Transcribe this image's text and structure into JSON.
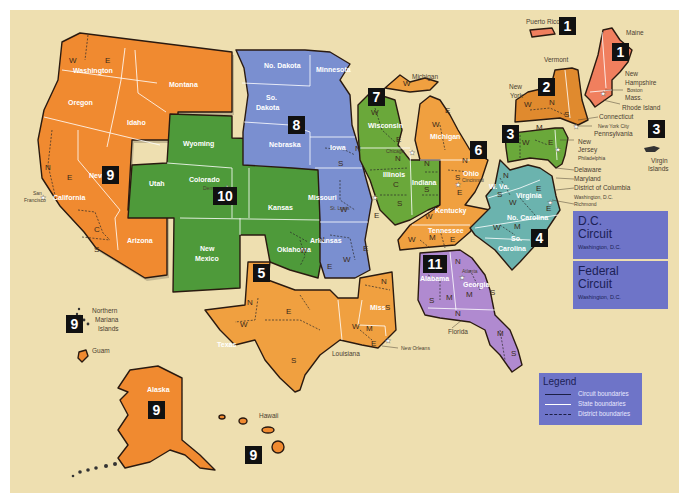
{
  "map": {
    "title": "Geographic Boundaries of United States Courts of Appeals and United States District Courts",
    "background_color": "#eedfb0",
    "circuit_colors": {
      "1": "#f07f5e",
      "2": "#e08a2e",
      "3": "#6aa83a",
      "4": "#6bb3ae",
      "5": "#f0a040",
      "6": "#f0a040",
      "7": "#6aa83a",
      "8": "#7a8fd0",
      "9": "#f08a30",
      "10": "#4e9a3a",
      "11": "#b08ad0"
    }
  },
  "circuits": [
    {
      "number": "1",
      "states": [
        "Maine",
        "New Hampshire",
        "Mass.",
        "Rhode Island",
        "Puerto Rico"
      ],
      "cities": [
        "Boston"
      ]
    },
    {
      "number": "2",
      "states": [
        "New York",
        "Vermont",
        "Connecticut"
      ],
      "cities": [
        "New York City"
      ]
    },
    {
      "number": "3",
      "states": [
        "Pennsylvania",
        "New Jersey",
        "Delaware",
        "Virgin Islands"
      ],
      "cities": [
        "Philadelphia"
      ]
    },
    {
      "number": "4",
      "states": [
        "W. Va.",
        "Virginia",
        "Maryland",
        "No. Carolina",
        "So. Carolina"
      ],
      "cities": [
        "Richmond"
      ]
    },
    {
      "number": "5",
      "states": [
        "Texas",
        "Louisiana",
        "Miss."
      ],
      "cities": [
        "New Orleans"
      ]
    },
    {
      "number": "6",
      "states": [
        "Michigan",
        "Ohio",
        "Kentucky",
        "Tennessee"
      ],
      "cities": [
        "Cincinnati"
      ]
    },
    {
      "number": "7",
      "states": [
        "Wisconsin",
        "Illinois",
        "Indiana"
      ],
      "cities": [
        "Chicago"
      ]
    },
    {
      "number": "8",
      "states": [
        "No. Dakota",
        "So. Dakota",
        "Minnesota",
        "Nebraska",
        "Iowa",
        "Missouri",
        "Arkansas"
      ],
      "cities": [
        "St. Louis"
      ]
    },
    {
      "number": "9",
      "states": [
        "Washington",
        "Oregon",
        "California",
        "Nevada",
        "Idaho",
        "Montana",
        "Arizona",
        "Alaska",
        "Hawaii",
        "Guam",
        "Northern Mariana Islands"
      ],
      "cities": [
        "San Francisco"
      ]
    },
    {
      "number": "10",
      "states": [
        "Wyoming",
        "Utah",
        "Colorado",
        "Kansas",
        "New Mexico",
        "Oklahoma"
      ],
      "cities": [
        "Denver"
      ]
    },
    {
      "number": "11",
      "states": [
        "Alabama",
        "Georgia",
        "Florida"
      ],
      "cities": [
        "Atlanta"
      ]
    }
  ],
  "badges": [
    {
      "id": "b1-pr",
      "label": "1",
      "x": 559,
      "y": 17
    },
    {
      "id": "b1-ne",
      "label": "1",
      "x": 612,
      "y": 43
    },
    {
      "id": "b2",
      "label": "2",
      "x": 538,
      "y": 78
    },
    {
      "id": "b3",
      "label": "3",
      "x": 502,
      "y": 125
    },
    {
      "id": "b3-vi",
      "label": "3",
      "x": 648,
      "y": 120
    },
    {
      "id": "b4",
      "label": "4",
      "x": 531,
      "y": 229
    },
    {
      "id": "b5",
      "label": "5",
      "x": 253,
      "y": 264
    },
    {
      "id": "b6",
      "label": "6",
      "x": 470,
      "y": 141
    },
    {
      "id": "b7",
      "label": "7",
      "x": 368,
      "y": 88
    },
    {
      "id": "b8",
      "label": "8",
      "x": 288,
      "y": 116
    },
    {
      "id": "b9-w",
      "label": "9",
      "x": 102,
      "y": 166
    },
    {
      "id": "b9-ak",
      "label": "9",
      "x": 148,
      "y": 401
    },
    {
      "id": "b9-hi",
      "label": "9",
      "x": 245,
      "y": 446
    },
    {
      "id": "b9-gu",
      "label": "9",
      "x": 66,
      "y": 315
    },
    {
      "id": "b10",
      "label": "10",
      "x": 213,
      "y": 187
    },
    {
      "id": "b11",
      "label": "11",
      "x": 423,
      "y": 255
    }
  ],
  "state_labels": [
    {
      "text": "Washington",
      "x": 73,
      "y": 73
    },
    {
      "text": "Oregon",
      "x": 68,
      "y": 105
    },
    {
      "text": "Montana",
      "x": 169,
      "y": 87
    },
    {
      "text": "Idaho",
      "x": 127,
      "y": 125
    },
    {
      "text": "Nevada",
      "x": 89,
      "y": 178
    },
    {
      "text": "California",
      "x": 53,
      "y": 200
    },
    {
      "text": "Arizona",
      "x": 127,
      "y": 243
    },
    {
      "text": "Wyoming",
      "x": 183,
      "y": 146
    },
    {
      "text": "Utah",
      "x": 149,
      "y": 186
    },
    {
      "text": "Colorado",
      "x": 189,
      "y": 182
    },
    {
      "text": "Kansas",
      "x": 268,
      "y": 210
    },
    {
      "text": "New",
      "x": 200,
      "y": 251
    },
    {
      "text": "Mexico",
      "x": 195,
      "y": 261
    },
    {
      "text": "Oklahoma",
      "x": 277,
      "y": 252
    },
    {
      "text": "No. Dakota",
      "x": 264,
      "y": 68
    },
    {
      "text": "Minnesota",
      "x": 316,
      "y": 72
    },
    {
      "text": "So.",
      "x": 266,
      "y": 100
    },
    {
      "text": "Dakota",
      "x": 256,
      "y": 110
    },
    {
      "text": "Nebraska",
      "x": 269,
      "y": 147
    },
    {
      "text": "Iowa",
      "x": 330,
      "y": 150
    },
    {
      "text": "Missouri",
      "x": 308,
      "y": 200
    },
    {
      "text": "Arkansas",
      "x": 310,
      "y": 243
    },
    {
      "text": "Wisconsin",
      "x": 368,
      "y": 128
    },
    {
      "text": "Illinois",
      "x": 383,
      "y": 177
    },
    {
      "text": "Indiana",
      "x": 412,
      "y": 185
    },
    {
      "text": "Michigan",
      "x": 430,
      "y": 139
    },
    {
      "text": "Ohio",
      "x": 463,
      "y": 176
    },
    {
      "text": "Kentucky",
      "x": 435,
      "y": 213
    },
    {
      "text": "Tennessee",
      "x": 428,
      "y": 233
    },
    {
      "text": "W. Va.",
      "x": 489,
      "y": 189
    },
    {
      "text": "Virginia",
      "x": 516,
      "y": 198
    },
    {
      "text": "No. Carolina",
      "x": 507,
      "y": 220
    },
    {
      "text": "So.",
      "x": 511,
      "y": 241
    },
    {
      "text": "Carolina",
      "x": 498,
      "y": 251
    },
    {
      "text": "Texas",
      "x": 217,
      "y": 347
    },
    {
      "text": "Miss.",
      "x": 370,
      "y": 310
    },
    {
      "text": "Alabama",
      "x": 420,
      "y": 281
    },
    {
      "text": "Georgia",
      "x": 463,
      "y": 287
    },
    {
      "text": "Alaska",
      "x": 147,
      "y": 392
    }
  ],
  "district_labels": [
    {
      "text": "W",
      "x": 69,
      "y": 63
    },
    {
      "text": "E",
      "x": 105,
      "y": 63
    },
    {
      "text": "N",
      "x": 45,
      "y": 170
    },
    {
      "text": "E",
      "x": 67,
      "y": 180
    },
    {
      "text": "C",
      "x": 94,
      "y": 232
    },
    {
      "text": "S",
      "x": 94,
      "y": 252
    },
    {
      "text": "W",
      "x": 300,
      "y": 253
    },
    {
      "text": "N",
      "x": 319,
      "y": 242
    },
    {
      "text": "E",
      "x": 327,
      "y": 269
    },
    {
      "text": "N",
      "x": 355,
      "y": 151
    },
    {
      "text": "S",
      "x": 338,
      "y": 166
    },
    {
      "text": "W",
      "x": 340,
      "y": 212
    },
    {
      "text": "E",
      "x": 374,
      "y": 218
    },
    {
      "text": "E",
      "x": 363,
      "y": 251
    },
    {
      "text": "W",
      "x": 343,
      "y": 262
    },
    {
      "text": "W",
      "x": 371,
      "y": 115
    },
    {
      "text": "E",
      "x": 396,
      "y": 142
    },
    {
      "text": "N",
      "x": 395,
      "y": 161
    },
    {
      "text": "C",
      "x": 393,
      "y": 187
    },
    {
      "text": "S",
      "x": 397,
      "y": 206
    },
    {
      "text": "N",
      "x": 424,
      "y": 166
    },
    {
      "text": "S",
      "x": 424,
      "y": 192
    },
    {
      "text": "W",
      "x": 403,
      "y": 86
    },
    {
      "text": "E",
      "x": 445,
      "y": 113
    },
    {
      "text": "W",
      "x": 432,
      "y": 127
    },
    {
      "text": "N",
      "x": 462,
      "y": 163
    },
    {
      "text": "S",
      "x": 455,
      "y": 180
    },
    {
      "text": "E",
      "x": 457,
      "y": 195
    },
    {
      "text": "W",
      "x": 425,
      "y": 219
    },
    {
      "text": "W",
      "x": 408,
      "y": 242
    },
    {
      "text": "M",
      "x": 429,
      "y": 240
    },
    {
      "text": "E",
      "x": 450,
      "y": 242
    },
    {
      "text": "W",
      "x": 522,
      "y": 145
    },
    {
      "text": "M",
      "x": 536,
      "y": 130
    },
    {
      "text": "E",
      "x": 548,
      "y": 145
    },
    {
      "text": "W",
      "x": 524,
      "y": 107
    },
    {
      "text": "N",
      "x": 549,
      "y": 105
    },
    {
      "text": "S",
      "x": 564,
      "y": 117
    },
    {
      "text": "N",
      "x": 503,
      "y": 178
    },
    {
      "text": "S",
      "x": 497,
      "y": 197
    },
    {
      "text": "W",
      "x": 509,
      "y": 205
    },
    {
      "text": "E",
      "x": 536,
      "y": 191
    },
    {
      "text": "E",
      "x": 546,
      "y": 211
    },
    {
      "text": "W",
      "x": 493,
      "y": 230
    },
    {
      "text": "M",
      "x": 514,
      "y": 229
    },
    {
      "text": "N",
      "x": 247,
      "y": 305
    },
    {
      "text": "W",
      "x": 240,
      "y": 327
    },
    {
      "text": "E",
      "x": 286,
      "y": 314
    },
    {
      "text": "S",
      "x": 291,
      "y": 363
    },
    {
      "text": "W",
      "x": 352,
      "y": 329
    },
    {
      "text": "M",
      "x": 366,
      "y": 331
    },
    {
      "text": "E",
      "x": 371,
      "y": 346
    },
    {
      "text": "N",
      "x": 381,
      "y": 284
    },
    {
      "text": "S",
      "x": 385,
      "y": 310
    },
    {
      "text": "N",
      "x": 437,
      "y": 265
    },
    {
      "text": "N",
      "x": 455,
      "y": 264
    },
    {
      "text": "S",
      "x": 429,
      "y": 303
    },
    {
      "text": "M",
      "x": 446,
      "y": 300
    },
    {
      "text": "M",
      "x": 466,
      "y": 297
    },
    {
      "text": "S",
      "x": 490,
      "y": 295
    },
    {
      "text": "N",
      "x": 455,
      "y": 316
    },
    {
      "text": "M",
      "x": 497,
      "y": 336
    },
    {
      "text": "S",
      "x": 511,
      "y": 356
    }
  ],
  "external_labels": [
    {
      "text": "Puerto Rico",
      "x": 526,
      "y": 24
    },
    {
      "text": "Maine",
      "x": 626,
      "y": 35
    },
    {
      "text": "Vermont",
      "x": 544,
      "y": 62
    },
    {
      "text": "New",
      "x": 509,
      "y": 89
    },
    {
      "text": "York",
      "x": 510,
      "y": 98
    },
    {
      "text": "New",
      "x": 625,
      "y": 76
    },
    {
      "text": "Hampshire",
      "x": 625,
      "y": 85
    },
    {
      "text": "Mass.",
      "x": 625,
      "y": 100
    },
    {
      "text": "Rhode Island",
      "x": 622,
      "y": 110
    },
    {
      "text": "Connecticut",
      "x": 599,
      "y": 119
    },
    {
      "text": "Pennsylvania",
      "x": 594,
      "y": 136
    },
    {
      "text": "New",
      "x": 578,
      "y": 144
    },
    {
      "text": "Jersey",
      "x": 578,
      "y": 152
    },
    {
      "text": "Delaware",
      "x": 574,
      "y": 172
    },
    {
      "text": "Maryland",
      "x": 574,
      "y": 181
    },
    {
      "text": "District of Columbia",
      "x": 574,
      "y": 190
    },
    {
      "text": "Virgin",
      "x": 651,
      "y": 163
    },
    {
      "text": "Islands",
      "x": 648,
      "y": 171
    },
    {
      "text": "Michigan",
      "x": 412,
      "y": 79
    },
    {
      "text": "Florida",
      "x": 448,
      "y": 334
    },
    {
      "text": "Louisiana",
      "x": 332,
      "y": 356
    },
    {
      "text": "Northern",
      "x": 92,
      "y": 313
    },
    {
      "text": "Mariana",
      "x": 95,
      "y": 322
    },
    {
      "text": "Islands",
      "x": 98,
      "y": 331
    },
    {
      "text": "Guam",
      "x": 92,
      "y": 353
    },
    {
      "text": "Hawaii",
      "x": 259,
      "y": 418
    }
  ],
  "city_labels": [
    {
      "text": "Boston",
      "x": 627,
      "y": 92
    },
    {
      "text": "New York City",
      "x": 598,
      "y": 128
    },
    {
      "text": "Philadelphia",
      "x": 578,
      "y": 160
    },
    {
      "text": "Washington, D.C.",
      "x": 574,
      "y": 199
    },
    {
      "text": "Richmond",
      "x": 574,
      "y": 206
    },
    {
      "text": "San",
      "x": 33,
      "y": 195
    },
    {
      "text": "Francisco",
      "x": 24,
      "y": 202
    },
    {
      "text": "Denver",
      "x": 203,
      "y": 190
    },
    {
      "text": "Chicago",
      "x": 386,
      "y": 153
    },
    {
      "text": "St. Louis",
      "x": 330,
      "y": 210
    },
    {
      "text": "Cincinnati",
      "x": 462,
      "y": 182
    },
    {
      "text": "Atlanta",
      "x": 462,
      "y": 273
    },
    {
      "text": "New Orleans",
      "x": 401,
      "y": 350
    }
  ],
  "dc_circuit": {
    "title_line1": "D.C.",
    "title_line2": "Circuit",
    "location": "Washington, D.C."
  },
  "federal_circuit": {
    "title_line1": "Federal",
    "title_line2": "Circuit",
    "location": "Washington, D.C."
  },
  "legend": {
    "title": "Legend",
    "items": [
      {
        "label": "Circuit boundaries",
        "style": "solid-dark"
      },
      {
        "label": "State boundaries",
        "style": "solid-white"
      },
      {
        "label": "District boundaries",
        "style": "dashed-dark"
      }
    ]
  }
}
